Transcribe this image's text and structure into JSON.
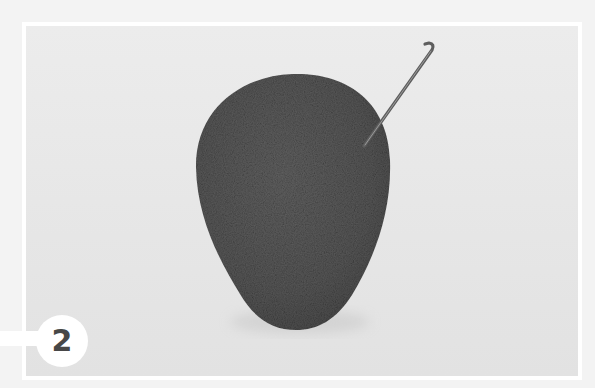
{
  "image": {
    "description": "Gray felted wool egg shape with a felting needle inserted near the upper right",
    "colors": {
      "outer_background": "#f3f3f3",
      "frame_border": "#ffffff",
      "photo_background": "#e8e8e8",
      "felt_body": "#5a5a5a",
      "needle": "#6a6a6a",
      "badge_background": "#ffffff",
      "badge_text": "#474747"
    }
  },
  "step_badge": {
    "number": "2"
  }
}
